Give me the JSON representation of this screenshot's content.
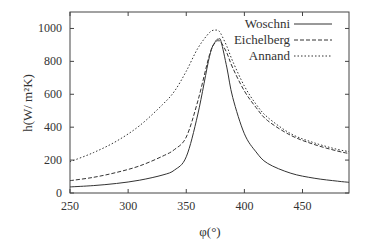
{
  "chart_data": {
    "type": "line",
    "title": "",
    "xlabel": "φ(°)",
    "ylabel": "h(W/ m²K)",
    "xlim": [
      250,
      490
    ],
    "ylim": [
      0,
      1100
    ],
    "xticks": [
      250,
      300,
      350,
      400,
      450
    ],
    "yticks": [
      0,
      200,
      400,
      600,
      800,
      1000
    ],
    "grid": false,
    "legend_position": "upper right",
    "x": [
      250,
      270,
      290,
      310,
      330,
      340,
      350,
      360,
      370,
      375,
      378,
      380,
      385,
      390,
      400,
      410,
      420,
      440,
      460,
      480,
      490
    ],
    "series": [
      {
        "name": "Woschni",
        "style": "solid",
        "values": [
          37,
          45,
          58,
          78,
          110,
          140,
          220,
          480,
          830,
          920,
          935,
          920,
          760,
          580,
          360,
          250,
          180,
          120,
          90,
          72,
          65
        ]
      },
      {
        "name": "Eichelberg",
        "style": "dashed",
        "values": [
          75,
          95,
          125,
          165,
          225,
          265,
          340,
          560,
          840,
          915,
          925,
          915,
          850,
          760,
          620,
          520,
          440,
          350,
          295,
          255,
          240
        ]
      },
      {
        "name": "Annand",
        "style": "dotted",
        "values": [
          190,
          245,
          315,
          410,
          540,
          620,
          740,
          880,
          975,
          990,
          985,
          965,
          890,
          800,
          650,
          540,
          460,
          360,
          305,
          265,
          252
        ]
      }
    ]
  }
}
